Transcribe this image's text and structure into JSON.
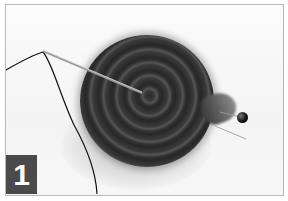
{
  "image": {
    "description": "Photo of a rolled dark felt strip coil with a threaded needle inserted and a black-headed pin on the right",
    "step_badge": {
      "label": "1",
      "color": "#4a4a4a",
      "text_color": "#ffffff"
    },
    "border_color": "#b8b8b8"
  }
}
